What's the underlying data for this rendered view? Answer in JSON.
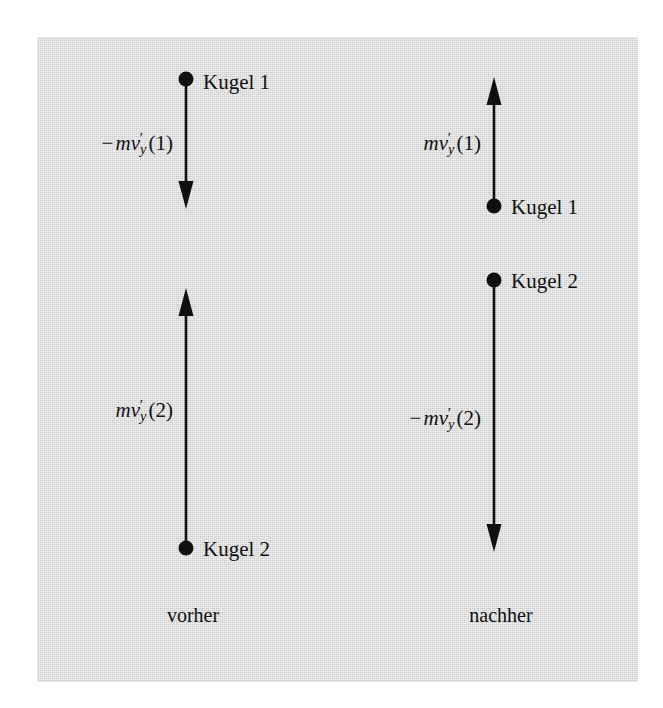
{
  "figure": {
    "background_color": "#cdcdcd",
    "ink_color": "#101010",
    "captions": {
      "before": "vorher",
      "after": "nachher"
    },
    "vectors": [
      {
        "id": "before-ball-1",
        "ball_label": "Kugel 1",
        "math_label": "−mv′_y(1)",
        "math_parts": {
          "sign": "−",
          "m": "m",
          "v": "v",
          "prime": "′",
          "sub": "y",
          "arg": "(1)"
        },
        "direction": "down",
        "column": "vorher",
        "x": 186,
        "dot_y": 79,
        "tip_y": 205
      },
      {
        "id": "before-ball-2",
        "ball_label": "Kugel 2",
        "math_label": "mv′_y(2)",
        "math_parts": {
          "sign": "",
          "m": "m",
          "v": "v",
          "prime": "′",
          "sub": "y",
          "arg": "(2)"
        },
        "direction": "up",
        "column": "vorher",
        "x": 186,
        "dot_y": 548,
        "tip_y": 288
      },
      {
        "id": "after-ball-1",
        "ball_label": "Kugel 1",
        "math_label": "mv′_y(1)",
        "math_parts": {
          "sign": "",
          "m": "m",
          "v": "v",
          "prime": "′",
          "sub": "y",
          "arg": "(1)"
        },
        "direction": "up",
        "column": "nachher",
        "x": 494,
        "dot_y": 206,
        "tip_y": 77
      },
      {
        "id": "after-ball-2",
        "ball_label": "Kugel 2",
        "math_label": "−mv′_y(2)",
        "math_parts": {
          "sign": "−",
          "m": "m",
          "v": "v",
          "prime": "′",
          "sub": "y",
          "arg": "(2)"
        },
        "direction": "down",
        "column": "nachher",
        "x": 494,
        "dot_y": 280,
        "tip_y": 548
      }
    ]
  }
}
